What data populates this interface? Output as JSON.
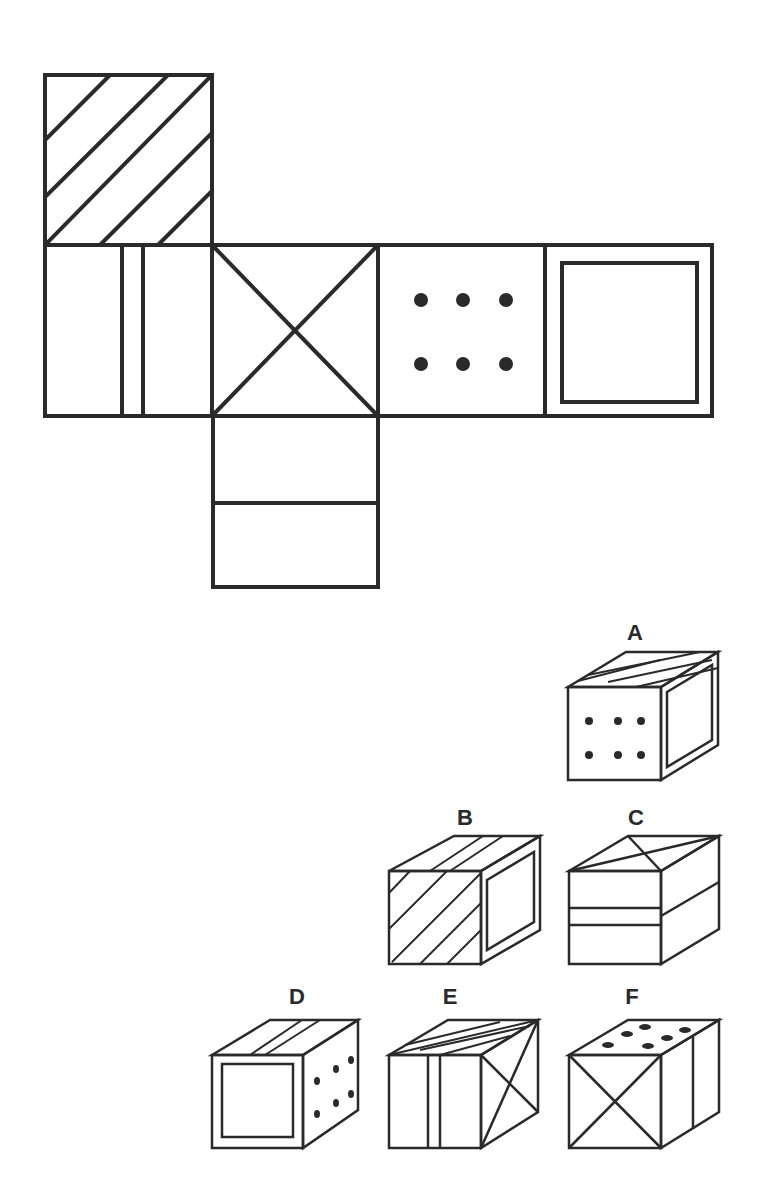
{
  "net": {
    "faces": [
      {
        "id": "top",
        "pattern": "diagonal-stripes"
      },
      {
        "id": "left",
        "pattern": "double-vertical-line"
      },
      {
        "id": "center",
        "pattern": "x-cross"
      },
      {
        "id": "right",
        "pattern": "six-dots"
      },
      {
        "id": "far-right",
        "pattern": "inner-square"
      },
      {
        "id": "bottom",
        "pattern": "horizontal-line"
      }
    ]
  },
  "options": [
    {
      "label": "A",
      "front": "six-dots",
      "top": "diagonal-stripes",
      "side": "inner-square"
    },
    {
      "label": "B",
      "front": "diagonal-stripes",
      "top": "diagonal-stripes",
      "side": "inner-square"
    },
    {
      "label": "C",
      "front": "horizontal-double-line",
      "top": "x-cross",
      "side": "horizontal-line"
    },
    {
      "label": "D",
      "front": "inner-square",
      "top": "double-line",
      "side": "six-dots"
    },
    {
      "label": "E",
      "front": "double-vertical-line",
      "top": "diagonal-stripes",
      "side": "x-cross"
    },
    {
      "label": "F",
      "front": "x-cross",
      "top": "six-dots",
      "side": "vertical-line"
    }
  ],
  "colors": {
    "ink": "#2a2a2a",
    "background": "#ffffff"
  }
}
